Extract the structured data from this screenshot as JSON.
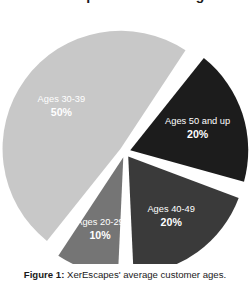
{
  "figure": {
    "title_remnant": "XerEscapes Customer Ages",
    "caption_label": "Figure 1:",
    "caption_text": "XerEscapes' average customer ages.",
    "background_color": "#ffffff",
    "gap_color": "#ffffff"
  },
  "chart_data": {
    "type": "pie",
    "title": "XerEscapes Customer Ages",
    "xlabel": "",
    "ylabel": "",
    "legend_position": "none",
    "grid": false,
    "exploded": true,
    "labels_inside_slices": true,
    "value_format": "percent",
    "categories": [
      "Ages 40-49",
      "Ages 20-29",
      "Ages 30-39",
      "Ages 50 and up"
    ],
    "values": [
      20,
      10,
      50,
      20
    ],
    "colors": [
      "#3a3a3a",
      "#757575",
      "#c8c8c8",
      "#1c1c1c"
    ],
    "slices": [
      {
        "label": "Ages 40-49",
        "value": 20,
        "value_label": "20%",
        "color": "#3a3a3a",
        "start_angle_deg": 18,
        "end_angle_deg": 90
      },
      {
        "label": "Ages 20-29",
        "value": 10,
        "value_label": "10%",
        "color": "#757575",
        "start_angle_deg": 90,
        "end_angle_deg": 126
      },
      {
        "label": "Ages 30-39",
        "value": 50,
        "value_label": "50%",
        "color": "#c8c8c8",
        "start_angle_deg": 126,
        "end_angle_deg": 306
      },
      {
        "label": "Ages 50 and up",
        "value": 20,
        "value_label": "20%",
        "color": "#1c1c1c",
        "start_angle_deg": 306,
        "end_angle_deg": 18
      }
    ]
  }
}
